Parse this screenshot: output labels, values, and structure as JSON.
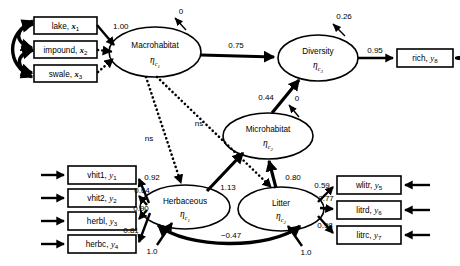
{
  "figure": {
    "type": "sem-path-diagram"
  },
  "observed_variables": {
    "exogenous": [
      {
        "id": "x1",
        "label": "lake,",
        "symbol": "x",
        "sub": "1"
      },
      {
        "id": "x2",
        "label": "impound,",
        "symbol": "x",
        "sub": "2"
      },
      {
        "id": "x3",
        "label": "swale,",
        "symbol": "x",
        "sub": "3"
      }
    ],
    "herbaceous_indicators": [
      {
        "id": "y1",
        "label": "vhit1,",
        "symbol": "y",
        "sub": "1"
      },
      {
        "id": "y2",
        "label": "vhit2,",
        "symbol": "y",
        "sub": "2"
      },
      {
        "id": "y3",
        "label": "herbl,",
        "symbol": "y",
        "sub": "3"
      },
      {
        "id": "y4",
        "label": "herbc,",
        "symbol": "y",
        "sub": "4"
      }
    ],
    "litter_indicators": [
      {
        "id": "y5",
        "label": "wlitr,",
        "symbol": "y",
        "sub": "5"
      },
      {
        "id": "y6",
        "label": "litrd,",
        "symbol": "y",
        "sub": "6"
      },
      {
        "id": "y7",
        "label": "litrc,",
        "symbol": "y",
        "sub": "7"
      }
    ],
    "diversity_indicator": {
      "id": "y8",
      "label": "rich,",
      "symbol": "y",
      "sub": "8"
    }
  },
  "latent_variables": [
    {
      "id": "macrohabitat",
      "label": "Macrohabitat",
      "eta": "η",
      "sub": "c",
      "subsub": "1"
    },
    {
      "id": "diversity",
      "label": "Diversity",
      "eta": "η",
      "sub": "c",
      "subsub": "3"
    },
    {
      "id": "microhabitat",
      "label": "Microhabitat",
      "eta": "η",
      "sub": "c",
      "subsub": "2"
    },
    {
      "id": "herbaceous",
      "label": "Herbaceous",
      "eta": "η",
      "sub": "c",
      "subsub": "1"
    },
    {
      "id": "litter",
      "label": "Litter",
      "eta": "η",
      "sub": "c",
      "subsub": "2"
    }
  ],
  "paths": {
    "measurement": [
      {
        "from": "x1",
        "to": "macrohabitat",
        "coef": "1.00",
        "style": "solid"
      },
      {
        "from": "x2",
        "to": "macrohabitat",
        "coef": "",
        "style": "dotted"
      },
      {
        "from": "x3",
        "to": "macrohabitat",
        "coef": "",
        "style": "dotted"
      },
      {
        "from": "herbaceous",
        "to": "y1",
        "coef": "0.92",
        "style": "solid"
      },
      {
        "from": "herbaceous",
        "to": "y2",
        "coef": "0.64",
        "style": "solid"
      },
      {
        "from": "herbaceous",
        "to": "y3",
        "coef": "0.90",
        "style": "solid"
      },
      {
        "from": "herbaceous",
        "to": "y4",
        "coef": "0.81",
        "style": "solid"
      },
      {
        "from": "litter",
        "to": "y5",
        "coef": "0.59",
        "style": "solid"
      },
      {
        "from": "litter",
        "to": "y6",
        "coef": "0.77",
        "style": "solid"
      },
      {
        "from": "litter",
        "to": "y7",
        "coef": "0.98",
        "style": "solid"
      },
      {
        "from": "diversity",
        "to": "y8",
        "coef": "0.95",
        "style": "solid"
      }
    ],
    "structural": [
      {
        "from": "macrohabitat",
        "to": "diversity",
        "coef": "0.75",
        "style": "solid"
      },
      {
        "from": "microhabitat",
        "to": "diversity",
        "coef": "0.44",
        "style": "solid"
      },
      {
        "from": "herbaceous",
        "to": "microhabitat",
        "coef": "1.13",
        "style": "solid"
      },
      {
        "from": "litter",
        "to": "microhabitat",
        "coef": "0.80",
        "style": "solid"
      },
      {
        "from": "macrohabitat",
        "to": "herbaceous",
        "coef": "ns",
        "style": "dotted"
      },
      {
        "from": "macrohabitat",
        "to": "litter",
        "coef": "ns",
        "style": "dotted"
      }
    ],
    "correlations": [
      {
        "between": [
          "herbaceous",
          "litter"
        ],
        "coef": "−0.47"
      },
      {
        "between": [
          "x1",
          "x2"
        ],
        "coef": ""
      },
      {
        "between": [
          "x2",
          "x3"
        ],
        "coef": ""
      },
      {
        "between": [
          "x1",
          "x3"
        ],
        "coef": ""
      }
    ],
    "disturbances": [
      {
        "target": "macrohabitat",
        "coef": "0"
      },
      {
        "target": "diversity",
        "coef": "0.26"
      },
      {
        "target": "microhabitat",
        "coef": "0"
      },
      {
        "target": "herbaceous",
        "coef": "1.0"
      },
      {
        "target": "litter",
        "coef": "1.0"
      }
    ]
  },
  "colors": {
    "stroke": "#000000",
    "fill": "#ffffff"
  }
}
